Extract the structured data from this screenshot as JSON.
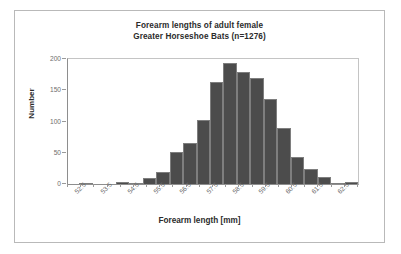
{
  "figure": {
    "frame_color": "#b9b9b9",
    "background": "#ffffff"
  },
  "chart_data": {
    "type": "bar",
    "title": "Forearm lengths of adult female Greater Horseshoe Bats (n=1276)",
    "title_lines": [
      "Forearm lengths of adult female",
      "Greater Horseshoe Bats (n=1276)"
    ],
    "xlabel": "Forearm length [mm]",
    "ylabel": "Number",
    "ylim": [
      0,
      200
    ],
    "yticks": [
      0,
      50,
      100,
      150,
      200
    ],
    "ytick_labels": [
      "0",
      "50",
      "100",
      "150",
      "200"
    ],
    "xtick_labels": [
      "52.5",
      "53.5",
      "54.5",
      "55.5",
      "56.5",
      "57.5",
      "58.5",
      "59.5",
      "60.5",
      "61.5",
      "62.5"
    ],
    "grid": false,
    "legend": null,
    "bin_width": 0.5,
    "bar_color": "#4c4c4c",
    "bar_edge_color": "#7e7e7e",
    "categories": [
      "52.0",
      "52.5",
      "53.0",
      "53.5",
      "54.0",
      "54.5",
      "55.0",
      "55.5",
      "56.0",
      "56.5",
      "57.0",
      "57.5",
      "58.0",
      "58.5",
      "59.0",
      "59.5",
      "60.0",
      "60.5",
      "61.0",
      "61.5",
      "62.0",
      "62.5"
    ],
    "values": [
      0,
      1,
      0,
      0,
      3,
      2,
      9,
      20,
      51,
      65,
      102,
      163,
      193,
      179,
      170,
      136,
      89,
      43,
      24,
      12,
      2,
      3
    ],
    "total_count": 1276
  }
}
